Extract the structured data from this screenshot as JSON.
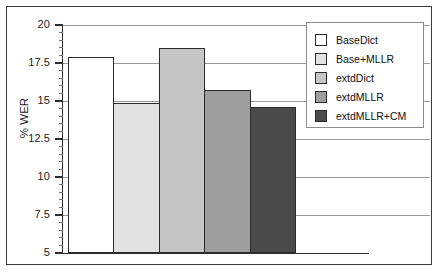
{
  "chart_data": {
    "type": "bar",
    "title": "",
    "xlabel": "",
    "ylabel": "% WER",
    "ylim": [
      5,
      20
    ],
    "yticks": [
      5,
      7.5,
      10,
      12.5,
      15,
      17.5,
      20
    ],
    "ytick_labels": [
      "5",
      "7.5",
      "10",
      "12.5",
      "15",
      "17.5",
      "20"
    ],
    "minor_tick_step": 0.5,
    "grid": "horizontal",
    "legend_position": "top-right",
    "categories": [
      "BaseDict",
      "Base+MLLR",
      "extdDict",
      "extdMLLR",
      "extdMLLR+CM"
    ],
    "values": [
      17.9,
      14.9,
      18.5,
      15.7,
      14.6
    ],
    "bar_colors": [
      "#ffffff",
      "#e2e2e2",
      "#c6c6c6",
      "#9e9e9e",
      "#4b4b4b"
    ],
    "bar_edge_color": "#2b2b2b"
  },
  "legend": {
    "items": [
      {
        "label": "BaseDict",
        "color": "#ffffff"
      },
      {
        "label": "Base+MLLR",
        "color": "#e2e2e2"
      },
      {
        "label": "extdDict",
        "color": "#c6c6c6"
      },
      {
        "label": "extdMLLR",
        "color": "#9e9e9e"
      },
      {
        "label": "extdMLLR+CM",
        "color": "#4b4b4b"
      }
    ]
  }
}
